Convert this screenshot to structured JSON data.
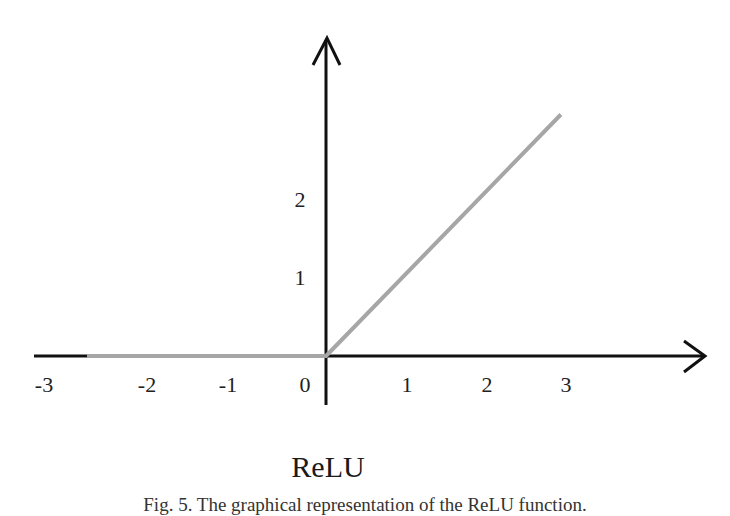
{
  "chart_data": {
    "type": "line",
    "title": "ReLU",
    "caption": "Fig. 5. The graphical representation of the ReLU function.",
    "xlabel": "",
    "ylabel": "",
    "x_ticks": [
      "-3",
      "-2",
      "-1",
      "0",
      "1",
      "2",
      "3"
    ],
    "y_ticks": [
      "1",
      "2"
    ],
    "xlim": [
      -3.6,
      4.7
    ],
    "ylim": [
      -0.6,
      4.0
    ],
    "grid": false,
    "legend": null,
    "series": [
      {
        "name": "ReLU",
        "color": "#a6a6a6",
        "x": [
          -2.95,
          0,
          2.9
        ],
        "y": [
          0,
          0,
          3.0
        ]
      }
    ],
    "axis_color": "#111111"
  }
}
